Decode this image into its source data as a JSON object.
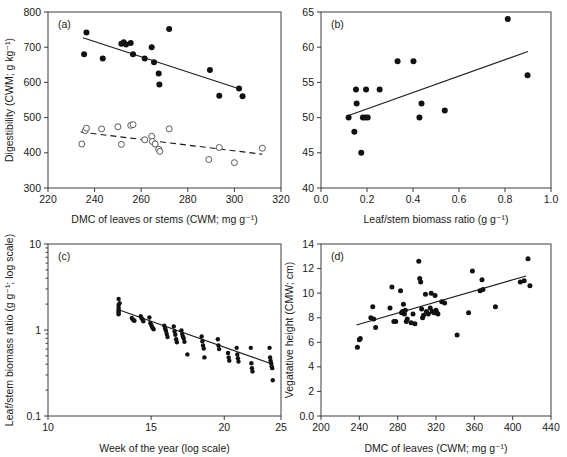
{
  "figure": {
    "title": "",
    "background": "#ffffff",
    "width": 567,
    "height": 457,
    "marker_filled_color": "#111111",
    "marker_open_color": "#ffffff",
    "line_color": "#1a1a1a"
  },
  "panels": {
    "a": {
      "letter": "(a)"
    },
    "b": {
      "letter": "(b)"
    },
    "c": {
      "letter": "(c)"
    },
    "d": {
      "letter": "(d)"
    }
  },
  "chart_data": [
    {
      "id": "a",
      "type": "scatter",
      "title": "(a)",
      "xlabel": "DMC of leaves or stems (CWM; mg g⁻¹)",
      "ylabel": "Digestibility (CWM; g kg⁻¹)",
      "xlim": [
        220,
        320
      ],
      "ylim": [
        300,
        800
      ],
      "xticks": [
        220,
        240,
        260,
        280,
        300,
        320
      ],
      "yticks": [
        300,
        400,
        500,
        600,
        700,
        800
      ],
      "grid": false,
      "legend": "none",
      "series": [
        {
          "name": "Leaves (filled circles)",
          "marker": "filled-circle",
          "points": [
            [
              235.5,
              680
            ],
            [
              236.5,
              742
            ],
            [
              243.5,
              668
            ],
            [
              251.5,
              710
            ],
            [
              252.5,
              714
            ],
            [
              253.5,
              708
            ],
            [
              255.5,
              712
            ],
            [
              256.5,
              680
            ],
            [
              261.5,
              668
            ],
            [
              264.5,
              700
            ],
            [
              265.5,
              657
            ],
            [
              267.5,
              625
            ],
            [
              267.8,
              594
            ],
            [
              272.0,
              752
            ],
            [
              289.5,
              635
            ],
            [
              293.5,
              562
            ],
            [
              302.0,
              583
            ],
            [
              303.5,
              561
            ]
          ],
          "trend": {
            "style": "solid",
            "x": [
              235,
              303
            ],
            "y": [
              727,
              580
            ]
          }
        },
        {
          "name": "Stems (open circles)",
          "marker": "open-circle",
          "points": [
            [
              234.5,
              425
            ],
            [
              236.0,
              463
            ],
            [
              236.5,
              470
            ],
            [
              243.0,
              468
            ],
            [
              250.0,
              474
            ],
            [
              251.5,
              424
            ],
            [
              255.5,
              478
            ],
            [
              256.5,
              480
            ],
            [
              261.5,
              437
            ],
            [
              264.5,
              447
            ],
            [
              264.8,
              432
            ],
            [
              266.0,
              425
            ],
            [
              267.5,
              410
            ],
            [
              268.0,
              404
            ],
            [
              272.0,
              468
            ],
            [
              289.0,
              381
            ],
            [
              293.5,
              415
            ],
            [
              300.0,
              372
            ],
            [
              312.0,
              413
            ]
          ],
          "trend": {
            "style": "dashed",
            "x": [
              234,
              312
            ],
            "y": [
              459,
              396
            ]
          }
        }
      ]
    },
    {
      "id": "b",
      "type": "scatter",
      "title": "(b)",
      "xlabel": "Leaf/stem biomass ratio (g g⁻¹)",
      "ylabel": "",
      "xlim": [
        0.0,
        1.0
      ],
      "ylim": [
        40,
        65
      ],
      "xticks": [
        0.0,
        0.2,
        0.4,
        0.6,
        0.8,
        1.0
      ],
      "yticks": [
        40,
        45,
        50,
        55,
        60,
        65
      ],
      "grid": false,
      "legend": "none",
      "series": [
        {
          "name": "Digestibility vs leaf/stem ratio",
          "marker": "filled-circle",
          "points": [
            [
              0.12,
              50.0
            ],
            [
              0.145,
              48.0
            ],
            [
              0.152,
              54.0
            ],
            [
              0.155,
              52.0
            ],
            [
              0.175,
              45.0
            ],
            [
              0.182,
              50.0
            ],
            [
              0.192,
              50.0
            ],
            [
              0.196,
              54.0
            ],
            [
              0.203,
              50.0
            ],
            [
              0.255,
              54.0
            ],
            [
              0.333,
              58.0
            ],
            [
              0.402,
              58.0
            ],
            [
              0.428,
              50.0
            ],
            [
              0.437,
              52.0
            ],
            [
              0.538,
              51.0
            ],
            [
              0.812,
              64.0
            ],
            [
              0.898,
              56.0
            ]
          ],
          "trend": {
            "style": "solid",
            "x": [
              0.12,
              0.9
            ],
            "y": [
              50.3,
              59.4
            ]
          }
        }
      ]
    },
    {
      "id": "c",
      "type": "scatter",
      "title": "(c)",
      "xlabel": "Week of the year (log scale)",
      "ylabel": "Leaf/stem biomass ratio (g g⁻¹; log scale)",
      "xscale": "log",
      "yscale": "log",
      "xlim": [
        10,
        25
      ],
      "ylim": [
        0.1,
        10
      ],
      "xticks": [
        10,
        15,
        20,
        25
      ],
      "yticks": [
        0.1,
        1,
        10
      ],
      "grid": false,
      "legend": "none",
      "series": [
        {
          "name": "Leaf/stem biomass ratio by week",
          "marker": "filled-circle",
          "points": [
            [
              13.2,
              2.3
            ],
            [
              13.2,
              1.95
            ],
            [
              13.2,
              1.82
            ],
            [
              13.2,
              1.72
            ],
            [
              13.2,
              1.64
            ],
            [
              13.2,
              1.58
            ],
            [
              13.2,
              1.52
            ],
            [
              13.25,
              2.05
            ],
            [
              13.9,
              1.38
            ],
            [
              13.95,
              1.33
            ],
            [
              14.0,
              1.3
            ],
            [
              14.05,
              1.28
            ],
            [
              14.4,
              1.45
            ],
            [
              14.45,
              1.37
            ],
            [
              14.5,
              1.33
            ],
            [
              14.55,
              1.26
            ],
            [
              14.9,
              1.4
            ],
            [
              14.95,
              1.21
            ],
            [
              15.0,
              1.15
            ],
            [
              15.05,
              1.1
            ],
            [
              15.1,
              1.05
            ],
            [
              15.15,
              1.02
            ],
            [
              15.8,
              1.12
            ],
            [
              15.85,
              1.04
            ],
            [
              15.9,
              0.98
            ],
            [
              15.95,
              0.9
            ],
            [
              16.0,
              0.83
            ],
            [
              16.4,
              1.1
            ],
            [
              16.45,
              0.96
            ],
            [
              16.5,
              0.88
            ],
            [
              16.55,
              0.78
            ],
            [
              16.6,
              0.72
            ],
            [
              16.9,
              0.99
            ],
            [
              16.95,
              0.9
            ],
            [
              17.0,
              0.84
            ],
            [
              17.05,
              0.8
            ],
            [
              17.1,
              0.73
            ],
            [
              17.3,
              0.52
            ],
            [
              18.3,
              0.84
            ],
            [
              18.35,
              0.74
            ],
            [
              18.4,
              0.66
            ],
            [
              18.45,
              0.61
            ],
            [
              18.5,
              0.48
            ],
            [
              19.5,
              0.78
            ],
            [
              19.55,
              0.66
            ],
            [
              19.6,
              0.6
            ],
            [
              20.3,
              0.54
            ],
            [
              20.35,
              0.48
            ],
            [
              20.4,
              0.44
            ],
            [
              21.0,
              0.62
            ],
            [
              21.05,
              0.52
            ],
            [
              21.1,
              0.47
            ],
            [
              21.15,
              0.43
            ],
            [
              22.2,
              0.62
            ],
            [
              22.25,
              0.41
            ],
            [
              22.3,
              0.36
            ],
            [
              22.35,
              0.33
            ],
            [
              23.9,
              0.62
            ],
            [
              23.95,
              0.48
            ],
            [
              24.0,
              0.44
            ],
            [
              24.05,
              0.41
            ],
            [
              24.1,
              0.38
            ],
            [
              24.15,
              0.36
            ],
            [
              24.2,
              0.26
            ]
          ],
          "trend": {
            "style": "solid",
            "x": [
              13.2,
              24.2
            ],
            "y": [
              1.72,
              0.4
            ]
          }
        }
      ]
    },
    {
      "id": "d",
      "type": "scatter",
      "title": "(d)",
      "xlabel": "DMC of leaves (CWM; mg g⁻¹)",
      "ylabel": "Vegatative height (CMW; cm)",
      "xlim": [
        200,
        440
      ],
      "ylim": [
        0,
        14
      ],
      "xticks": [
        200,
        240,
        280,
        320,
        360,
        400,
        440
      ],
      "yticks": [
        0,
        2,
        4,
        6,
        8,
        10,
        12,
        14
      ],
      "grid": false,
      "legend": "none",
      "series": [
        {
          "name": "Vegetative height vs DMC of leaves",
          "marker": "filled-circle",
          "points": [
            [
              238,
              5.6
            ],
            [
              240,
              6.2
            ],
            [
              241,
              6.3
            ],
            [
              252,
              8.0
            ],
            [
              254,
              8.9
            ],
            [
              255,
              7.9
            ],
            [
              257,
              7.2
            ],
            [
              272,
              8.8
            ],
            [
              274,
              10.5
            ],
            [
              276,
              7.7
            ],
            [
              278,
              7.7
            ],
            [
              283,
              10.2
            ],
            [
              284,
              8.4
            ],
            [
              285,
              8.5
            ],
            [
              286,
              9.1
            ],
            [
              287,
              8.3
            ],
            [
              288,
              8.6
            ],
            [
              289,
              7.7
            ],
            [
              290,
              7.9
            ],
            [
              294,
              7.6
            ],
            [
              296,
              8.3
            ],
            [
              298,
              7.5
            ],
            [
              302,
              12.6
            ],
            [
              303,
              11.2
            ],
            [
              304,
              10.9
            ],
            [
              305,
              8.7
            ],
            [
              306,
              8.0
            ],
            [
              307,
              8.2
            ],
            [
              309,
              9.9
            ],
            [
              310,
              8.5
            ],
            [
              312,
              8.3
            ],
            [
              314,
              8.8
            ],
            [
              315,
              10.0
            ],
            [
              316,
              8.5
            ],
            [
              318,
              8.4
            ],
            [
              319,
              9.8
            ],
            [
              320,
              8.6
            ],
            [
              321,
              8.4
            ],
            [
              322,
              8.3
            ],
            [
              326,
              9.3
            ],
            [
              329,
              9.2
            ],
            [
              342,
              6.6
            ],
            [
              354,
              8.4
            ],
            [
              358,
              11.8
            ],
            [
              366,
              10.2
            ],
            [
              368,
              11.1
            ],
            [
              369,
              10.3
            ],
            [
              382,
              8.9
            ],
            [
              408,
              10.9
            ],
            [
              412,
              11.0
            ],
            [
              416,
              12.8
            ],
            [
              418,
              10.6
            ]
          ],
          "trend": {
            "style": "solid",
            "x": [
              237,
              414
            ],
            "y": [
              7.4,
              11.4
            ]
          }
        }
      ]
    }
  ]
}
